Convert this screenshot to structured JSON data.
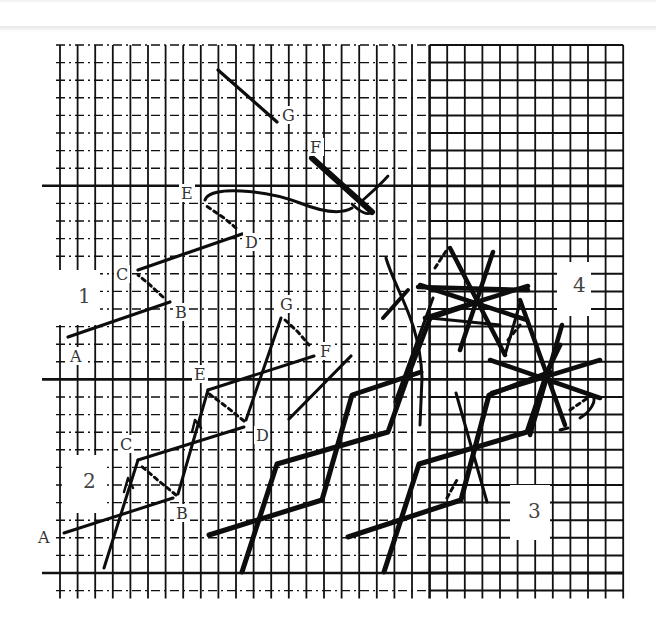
{
  "figure": {
    "grid": {
      "x0": 60,
      "y0": 45,
      "cell": 17.6,
      "cols": 32,
      "rows": 31,
      "thick_rows": [
        8,
        19,
        30
      ],
      "thick_cols": [
        21
      ],
      "line_color": "#111111"
    },
    "sections": [
      {
        "number": "1",
        "x": 78,
        "y": 303,
        "label_box": [
          55,
          270,
          45,
          55
        ]
      },
      {
        "number": "2",
        "x": 83,
        "y": 488,
        "label_box": [
          62,
          455,
          42,
          58
        ]
      },
      {
        "number": "3",
        "x": 528,
        "y": 518,
        "label_box": [
          510,
          485,
          40,
          55
        ]
      },
      {
        "number": "4",
        "x": 573,
        "y": 292,
        "label_box": [
          557,
          262,
          34,
          54
        ]
      }
    ],
    "point_labels": {
      "section_1": [
        {
          "text": "A",
          "x": 70,
          "y": 362
        },
        {
          "text": "B",
          "x": 175,
          "y": 318
        },
        {
          "text": "C",
          "x": 116,
          "y": 280
        },
        {
          "text": "D",
          "x": 245,
          "y": 248
        },
        {
          "text": "E",
          "x": 181,
          "y": 199
        },
        {
          "text": "F",
          "x": 310,
          "y": 153
        },
        {
          "text": "G",
          "x": 282,
          "y": 121
        }
      ],
      "section_2": [
        {
          "text": "A",
          "x": 38,
          "y": 543
        },
        {
          "text": "B",
          "x": 176,
          "y": 519
        },
        {
          "text": "C",
          "x": 120,
          "y": 450
        },
        {
          "text": "D",
          "x": 256,
          "y": 441
        },
        {
          "text": "E",
          "x": 194,
          "y": 380
        },
        {
          "text": "G",
          "x": 280,
          "y": 310
        },
        {
          "text": "F",
          "x": 320,
          "y": 357
        }
      ]
    },
    "ink_color": "#0d0d0d"
  }
}
